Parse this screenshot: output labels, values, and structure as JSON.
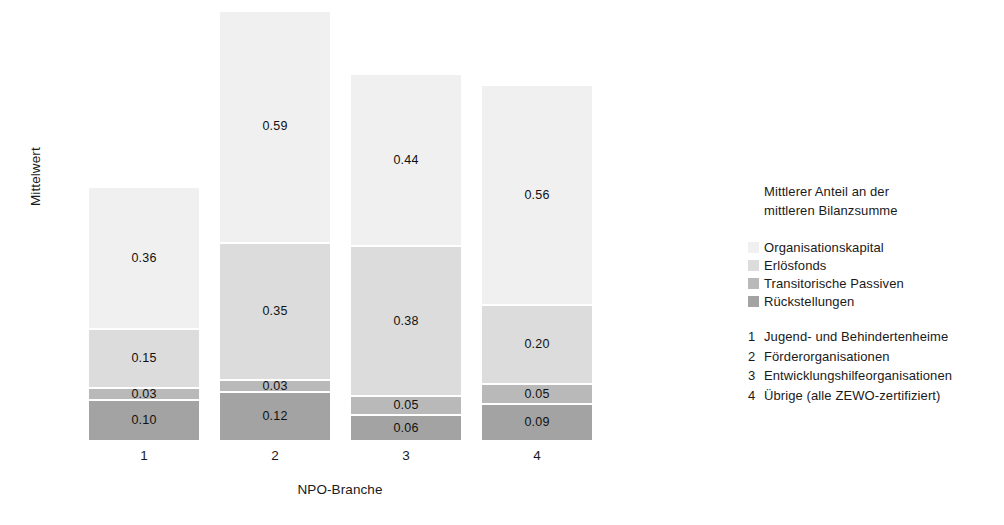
{
  "chart_data": {
    "type": "bar",
    "subtype": "stacked-bar",
    "title": "",
    "xlabel": "NPO-Branche",
    "ylabel": "Mittelwert",
    "categories": [
      "1",
      "2",
      "3",
      "4"
    ],
    "grid": false,
    "legend_position": "right",
    "ylim": [
      0,
      1.12
    ],
    "series": [
      {
        "name": "Organisationskapital",
        "color": "#f0f0f0",
        "values": [
          0.36,
          0.59,
          0.44,
          0.56
        ],
        "labels": [
          "0.36",
          "0.59",
          "0.44",
          "0.56"
        ]
      },
      {
        "name": "Erlösfonds",
        "color": "#dcdcdc",
        "values": [
          0.15,
          0.35,
          0.38,
          0.2
        ],
        "labels": [
          "0.15",
          "0.35",
          "0.38",
          "0.20"
        ]
      },
      {
        "name": "Transitorische Passiven",
        "color": "#b9b9b9",
        "values": [
          0.03,
          0.03,
          0.05,
          0.05
        ],
        "labels": [
          "0.03",
          "0.03",
          "0.05",
          "0.05"
        ]
      },
      {
        "name": "Rückstellungen",
        "color": "#a3a3a3",
        "values": [
          0.1,
          0.12,
          0.06,
          0.09
        ],
        "labels": [
          "0.10",
          "0.12",
          "0.06",
          "0.09"
        ]
      }
    ]
  },
  "axes": {
    "y_title": "Mittelwert",
    "x_title": "NPO-Branche",
    "x_ticks": [
      "1",
      "2",
      "3",
      "4"
    ]
  },
  "legend": {
    "title_line1": "Mittlerer Anteil an der",
    "title_line2": "mittleren Bilanzsumme",
    "keys": [
      {
        "label": "Organisationskapital",
        "color": "#f0f0f0"
      },
      {
        "label": "Erlösfonds",
        "color": "#dcdcdc"
      },
      {
        "label": "Transitorische Passiven",
        "color": "#b9b9b9"
      },
      {
        "label": "Rückstellungen",
        "color": "#a3a3a3"
      }
    ],
    "categories": [
      {
        "num": "1",
        "label": "Jugend- und Behindertenheime"
      },
      {
        "num": "2",
        "label": "Förderorganisationen"
      },
      {
        "num": "3",
        "label": "Entwicklungshilfeorganisationen"
      },
      {
        "num": "4",
        "label": "Übrige (alle ZEWO-zertifiziert)"
      }
    ]
  }
}
